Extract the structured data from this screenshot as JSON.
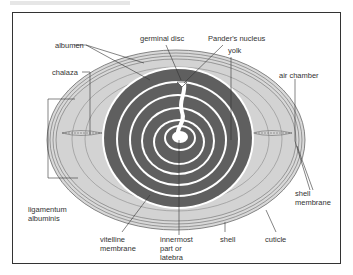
{
  "colors": {
    "albumen": "#d3d3d3",
    "yolk_dark": "#5f5f5f",
    "yolk_light": "#ffffff",
    "shell_line": "#6a6a6a",
    "frame": "#333333"
  },
  "labels": {
    "albumen": "albumen",
    "germinal_disc": "germinal disc",
    "panders_nucleus": "Pander's nucleus",
    "yolk": "yolk",
    "chalaza": "chalaza",
    "air_chamber": "air chamber",
    "ligamentum_line1": "ligamentum",
    "ligamentum_line2": "albuminis",
    "shell_membrane_line1": "shell",
    "shell_membrane_line2": "membrane",
    "vitelline_line1": "vitelline",
    "vitelline_line2": "membrane",
    "innermost_line1": "innermost",
    "innermost_line2": "part or",
    "innermost_line3": "latebra",
    "shell": "shell",
    "cuticle": "cuticle"
  }
}
